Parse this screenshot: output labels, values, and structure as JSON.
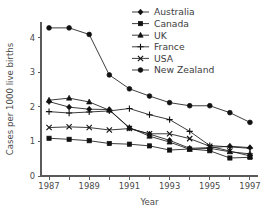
{
  "chart_data": {
    "type": "line",
    "title": "",
    "xlabel": "Year",
    "ylabel": "Cases per 1000 live births",
    "x": [
      1987,
      1988,
      1989,
      1990,
      1991,
      1992,
      1993,
      1994,
      1995,
      1996,
      1997
    ],
    "xlim": [
      1986.6,
      1997.4
    ],
    "ylim": [
      0,
      4.45
    ],
    "xticks": [
      1987,
      1988,
      1989,
      1990,
      1991,
      1992,
      1993,
      1994,
      1995,
      1996,
      1997
    ],
    "xtick_labels": [
      "1987",
      "",
      "1989",
      "",
      "1991",
      "",
      "1993",
      "",
      "1995",
      "",
      "1997"
    ],
    "yticks": [
      0,
      1,
      2,
      3,
      4
    ],
    "ytick_labels": [
      "0",
      "1",
      "2",
      "3",
      "4"
    ],
    "grid": false,
    "legend_position": "top-right",
    "series": [
      {
        "name": "Australia",
        "marker": "diamond",
        "values": [
          2.15,
          1.99,
          1.93,
          1.92,
          1.38,
          1.21,
          1.03,
          0.8,
          0.82,
          0.86,
          0.82
        ]
      },
      {
        "name": "Canada",
        "marker": "square",
        "values": [
          1.09,
          1.06,
          1.02,
          0.94,
          0.92,
          0.87,
          0.75,
          0.78,
          0.73,
          0.52,
          0.54
        ]
      },
      {
        "name": "UK",
        "marker": "triangle",
        "values": [
          2.19,
          2.25,
          2.14,
          1.9,
          1.4,
          1.15,
          0.98,
          0.77,
          0.8,
          0.7,
          0.64
        ]
      },
      {
        "name": "France",
        "marker": "plus",
        "values": [
          1.86,
          1.82,
          1.85,
          1.88,
          1.95,
          1.77,
          1.63,
          1.29,
          0.88,
          0.84,
          0.8
        ]
      },
      {
        "name": "USA",
        "marker": "x",
        "values": [
          1.4,
          1.42,
          1.4,
          1.33,
          1.37,
          1.22,
          1.22,
          1.08,
          0.86,
          0.72,
          0.58
        ]
      },
      {
        "name": "New Zealand",
        "marker": "circle",
        "values": [
          4.28,
          4.28,
          4.09,
          2.92,
          2.52,
          2.31,
          2.12,
          2.03,
          2.03,
          1.83,
          1.55
        ]
      }
    ]
  },
  "legend": {
    "entries": [
      {
        "label": "Australia"
      },
      {
        "label": "Canada"
      },
      {
        "label": "UK"
      },
      {
        "label": "France"
      },
      {
        "label": "USA"
      },
      {
        "label": "New Zealand"
      }
    ]
  },
  "colors": {
    "ink": "#1a1a1a",
    "axis": "#5a5a5a",
    "background": "#ffffff"
  }
}
